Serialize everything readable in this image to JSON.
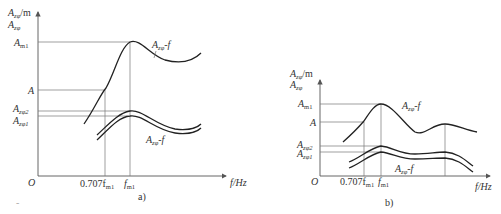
{
  "figure_a": {
    "caption": "a)",
    "y_axis_label_top": "A",
    "y_axis_label_top_sub": "zφ",
    "y_axis_label_top_unit": "/m",
    "y_axis_label_second": "A",
    "y_axis_label_second_sub": "zφ",
    "origin": "O",
    "x_axis_label": "f/Hz",
    "y_ticks": [
      {
        "main": "A",
        "sub": "m1"
      },
      {
        "main": "A",
        "sub": ""
      },
      {
        "main": "A",
        "sub": "zφ2"
      },
      {
        "main": "A",
        "sub": "zφ1"
      }
    ],
    "x_ticks": [
      {
        "main": "0.707f",
        "sub": "m1"
      },
      {
        "main": "f",
        "sub": "m1"
      }
    ],
    "curve_labels": [
      {
        "main": "A",
        "sub": "zφ",
        "rest": "-f"
      },
      {
        "main": "A",
        "sub": "zφ",
        "rest": "-f"
      }
    ]
  },
  "figure_b": {
    "caption": "b)",
    "y_axis_label_top": "A",
    "y_axis_label_top_sub": "zφ",
    "y_axis_label_top_unit": "/m",
    "y_axis_label_second": "A",
    "y_axis_label_second_sub": "zφ",
    "origin": "O",
    "x_axis_label": "f/Hz",
    "y_ticks": [
      {
        "main": "A",
        "sub": "m1"
      },
      {
        "main": "A",
        "sub": ""
      },
      {
        "main": "A",
        "sub": "zφ2"
      },
      {
        "main": "A",
        "sub": "zφ1"
      }
    ],
    "x_ticks": [
      {
        "main": "0.707f",
        "sub": "m1"
      },
      {
        "main": "f",
        "sub": "m1"
      }
    ],
    "curve_labels": [
      {
        "main": "A",
        "sub": "zφ",
        "rest": "-f"
      },
      {
        "main": "A",
        "sub": "zφ",
        "rest": "-f"
      }
    ]
  },
  "page_mark": "-"
}
